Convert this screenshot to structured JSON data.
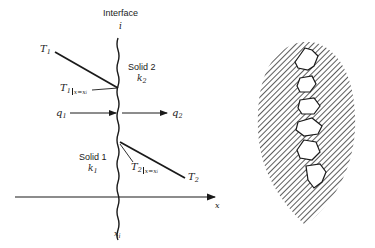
{
  "left_diagram": {
    "interface_label": "Interface",
    "interface_symbol": "i",
    "solid2": {
      "name": "Solid 2",
      "k": "k",
      "k_sub": "2"
    },
    "solid1": {
      "name": "Solid 1",
      "k": "k",
      "k_sub": "1"
    },
    "T1": {
      "sym": "T",
      "sub": "1"
    },
    "T2": {
      "sym": "T",
      "sub": "2"
    },
    "T1_interface": {
      "sym": "T",
      "sub": "1",
      "eval": "x=x",
      "eval_sub": "i"
    },
    "T2_interface": {
      "sym": "T",
      "sub": "2",
      "eval": "x=x",
      "eval_sub": "i"
    },
    "q1": {
      "sym": "q",
      "sub": "1"
    },
    "q2": {
      "sym": "q",
      "sub": "2"
    },
    "x_axis_label": "x",
    "xi_label": {
      "sym": "x",
      "sub": "i"
    }
  },
  "right_diagram": {
    "description": "Magnified rough interface contact between two hatched solids with voids"
  },
  "colors": {
    "ink": "#1a1a1a",
    "background": "#ffffff"
  }
}
